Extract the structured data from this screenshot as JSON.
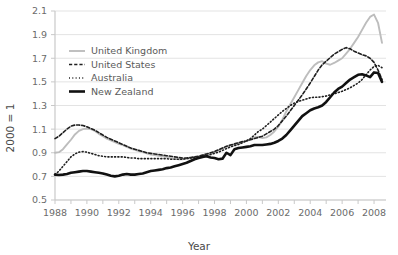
{
  "chart_data": {
    "type": "line",
    "title": "",
    "xlabel": "Year",
    "ylabel": "2000 = 1",
    "xlim": [
      1988,
      2008.75
    ],
    "ylim": [
      0.5,
      2.1
    ],
    "yticks": [
      0.5,
      0.7,
      0.9,
      1.1,
      1.3,
      1.5,
      1.7,
      1.9,
      2.1
    ],
    "ytick_labels": [
      "0.5",
      "0.7",
      "0.9",
      "1.1",
      "1.3",
      "1.5",
      "1.7",
      "1.9",
      "2.1"
    ],
    "xticks": [
      1988,
      1990,
      1992,
      1994,
      1996,
      1998,
      2000,
      2002,
      2004,
      2006,
      2008
    ],
    "xtick_labels": [
      "1988",
      "1990",
      "1992",
      "1994",
      "1996",
      "1998",
      "2000",
      "2002",
      "2004",
      "2006",
      "2008"
    ],
    "xminor_step": 1,
    "grid": "horizontal",
    "legend_position": "upper-left-inside",
    "colors": {
      "united_kingdom": "#bdbdbd",
      "united_states": "#1f1f1f",
      "australia": "#1f1f1f",
      "new_zealand": "#111111",
      "grid": "#e3e3e3",
      "axis": "#c9c9c9",
      "text": "#6b6b6b"
    },
    "series": [
      {
        "name": "United Kingdom",
        "style": "solid",
        "color": "#bdbdbd",
        "width": 1.9,
        "x": [
          1988.0,
          1988.25,
          1988.5,
          1988.75,
          1989.0,
          1989.25,
          1989.5,
          1989.75,
          1990.0,
          1990.25,
          1990.5,
          1990.75,
          1991.0,
          1991.25,
          1991.5,
          1991.75,
          1992.0,
          1992.25,
          1992.5,
          1992.75,
          1993.0,
          1993.25,
          1993.5,
          1993.75,
          1994.0,
          1994.25,
          1994.5,
          1994.75,
          1995.0,
          1995.25,
          1995.5,
          1995.75,
          1996.0,
          1996.25,
          1996.5,
          1996.75,
          1997.0,
          1997.25,
          1997.5,
          1997.75,
          1998.0,
          1998.25,
          1998.5,
          1998.75,
          1999.0,
          1999.25,
          1999.5,
          1999.75,
          2000.0,
          2000.25,
          2000.5,
          2000.75,
          2001.0,
          2001.25,
          2001.5,
          2001.75,
          2002.0,
          2002.25,
          2002.5,
          2002.75,
          2003.0,
          2003.25,
          2003.5,
          2003.75,
          2004.0,
          2004.25,
          2004.5,
          2004.75,
          2005.0,
          2005.25,
          2005.5,
          2005.75,
          2006.0,
          2006.25,
          2006.5,
          2006.75,
          2007.0,
          2007.25,
          2007.5,
          2007.75,
          2008.0,
          2008.25,
          2008.5
        ],
        "y": [
          0.9,
          0.905,
          0.93,
          0.97,
          1.01,
          1.055,
          1.085,
          1.1,
          1.105,
          1.1,
          1.085,
          1.06,
          1.04,
          1.02,
          1.005,
          0.99,
          0.975,
          0.965,
          0.95,
          0.935,
          0.925,
          0.915,
          0.905,
          0.895,
          0.885,
          0.88,
          0.875,
          0.87,
          0.865,
          0.855,
          0.85,
          0.845,
          0.845,
          0.85,
          0.855,
          0.86,
          0.865,
          0.875,
          0.885,
          0.895,
          0.905,
          0.92,
          0.935,
          0.95,
          0.96,
          0.97,
          0.98,
          0.99,
          1.0,
          1.015,
          1.03,
          1.035,
          1.025,
          1.03,
          1.05,
          1.08,
          1.12,
          1.18,
          1.25,
          1.31,
          1.37,
          1.43,
          1.49,
          1.55,
          1.6,
          1.64,
          1.665,
          1.675,
          1.655,
          1.645,
          1.66,
          1.68,
          1.7,
          1.74,
          1.78,
          1.83,
          1.88,
          1.94,
          2.0,
          2.05,
          2.07,
          2.0,
          1.83
        ]
      },
      {
        "name": "United States",
        "style": "dashed",
        "color": "#1f1f1f",
        "width": 1.6,
        "x": [
          1988.0,
          1988.25,
          1988.5,
          1988.75,
          1989.0,
          1989.25,
          1989.5,
          1989.75,
          1990.0,
          1990.25,
          1990.5,
          1990.75,
          1991.0,
          1991.25,
          1991.5,
          1991.75,
          1992.0,
          1992.25,
          1992.5,
          1992.75,
          1993.0,
          1993.25,
          1993.5,
          1993.75,
          1994.0,
          1994.25,
          1994.5,
          1994.75,
          1995.0,
          1995.25,
          1995.5,
          1995.75,
          1996.0,
          1996.25,
          1996.5,
          1996.75,
          1997.0,
          1997.25,
          1997.5,
          1997.75,
          1998.0,
          1998.25,
          1998.5,
          1998.75,
          1999.0,
          1999.25,
          1999.5,
          1999.75,
          2000.0,
          2000.25,
          2000.5,
          2000.75,
          2001.0,
          2001.25,
          2001.5,
          2001.75,
          2002.0,
          2002.25,
          2002.5,
          2002.75,
          2003.0,
          2003.25,
          2003.5,
          2003.75,
          2004.0,
          2004.25,
          2004.5,
          2004.75,
          2005.0,
          2005.25,
          2005.5,
          2005.75,
          2006.0,
          2006.25,
          2006.5,
          2006.75,
          2007.0,
          2007.25,
          2007.5,
          2007.75,
          2008.0,
          2008.25,
          2008.5
        ],
        "y": [
          1.02,
          1.04,
          1.07,
          1.1,
          1.125,
          1.135,
          1.135,
          1.13,
          1.12,
          1.105,
          1.09,
          1.07,
          1.05,
          1.03,
          1.015,
          1.0,
          0.985,
          0.97,
          0.955,
          0.94,
          0.93,
          0.92,
          0.91,
          0.9,
          0.895,
          0.89,
          0.885,
          0.88,
          0.875,
          0.87,
          0.865,
          0.86,
          0.855,
          0.855,
          0.86,
          0.865,
          0.87,
          0.88,
          0.89,
          0.9,
          0.91,
          0.925,
          0.94,
          0.955,
          0.965,
          0.975,
          0.985,
          0.995,
          1.0,
          1.01,
          1.02,
          1.03,
          1.04,
          1.06,
          1.08,
          1.1,
          1.13,
          1.17,
          1.21,
          1.255,
          1.3,
          1.345,
          1.39,
          1.44,
          1.49,
          1.545,
          1.6,
          1.645,
          1.675,
          1.705,
          1.735,
          1.755,
          1.775,
          1.79,
          1.78,
          1.76,
          1.745,
          1.73,
          1.72,
          1.7,
          1.665,
          1.6,
          1.52
        ]
      },
      {
        "name": "Australia",
        "style": "dotted",
        "color": "#1f1f1f",
        "width": 1.6,
        "x": [
          1988.0,
          1988.25,
          1988.5,
          1988.75,
          1989.0,
          1989.25,
          1989.5,
          1989.75,
          1990.0,
          1990.25,
          1990.5,
          1990.75,
          1991.0,
          1991.25,
          1991.5,
          1991.75,
          1992.0,
          1992.25,
          1992.5,
          1992.75,
          1993.0,
          1993.25,
          1993.5,
          1993.75,
          1994.0,
          1994.25,
          1994.5,
          1994.75,
          1995.0,
          1995.25,
          1995.5,
          1995.75,
          1996.0,
          1996.25,
          1996.5,
          1996.75,
          1997.0,
          1997.25,
          1997.5,
          1997.75,
          1998.0,
          1998.25,
          1998.5,
          1998.75,
          1999.0,
          1999.25,
          1999.5,
          1999.75,
          2000.0,
          2000.25,
          2000.5,
          2000.75,
          2001.0,
          2001.25,
          2001.5,
          2001.75,
          2002.0,
          2002.25,
          2002.5,
          2002.75,
          2003.0,
          2003.25,
          2003.5,
          2003.75,
          2004.0,
          2004.25,
          2004.5,
          2004.75,
          2005.0,
          2005.25,
          2005.5,
          2005.75,
          2006.0,
          2006.25,
          2006.5,
          2006.75,
          2007.0,
          2007.25,
          2007.5,
          2007.75,
          2008.0,
          2008.25,
          2008.5
        ],
        "y": [
          0.715,
          0.745,
          0.785,
          0.825,
          0.865,
          0.89,
          0.905,
          0.91,
          0.905,
          0.895,
          0.885,
          0.875,
          0.87,
          0.865,
          0.865,
          0.865,
          0.865,
          0.865,
          0.86,
          0.855,
          0.855,
          0.85,
          0.85,
          0.85,
          0.85,
          0.85,
          0.85,
          0.85,
          0.85,
          0.845,
          0.845,
          0.845,
          0.845,
          0.85,
          0.855,
          0.86,
          0.865,
          0.87,
          0.875,
          0.885,
          0.895,
          0.905,
          0.92,
          0.935,
          0.95,
          0.96,
          0.97,
          0.985,
          1.0,
          1.02,
          1.05,
          1.08,
          1.1,
          1.13,
          1.16,
          1.19,
          1.22,
          1.25,
          1.275,
          1.3,
          1.32,
          1.335,
          1.345,
          1.355,
          1.365,
          1.37,
          1.37,
          1.375,
          1.38,
          1.39,
          1.4,
          1.41,
          1.42,
          1.435,
          1.45,
          1.47,
          1.49,
          1.52,
          1.56,
          1.6,
          1.63,
          1.64,
          1.62
        ]
      },
      {
        "name": "New Zealand",
        "style": "solid",
        "color": "#111111",
        "width": 2.6,
        "x": [
          1988.0,
          1988.25,
          1988.5,
          1988.75,
          1989.0,
          1989.25,
          1989.5,
          1989.75,
          1990.0,
          1990.25,
          1990.5,
          1990.75,
          1991.0,
          1991.25,
          1991.5,
          1991.75,
          1992.0,
          1992.25,
          1992.5,
          1992.75,
          1993.0,
          1993.25,
          1993.5,
          1993.75,
          1994.0,
          1994.25,
          1994.5,
          1994.75,
          1995.0,
          1995.25,
          1995.5,
          1995.75,
          1996.0,
          1996.25,
          1996.5,
          1996.75,
          1997.0,
          1997.25,
          1997.5,
          1997.75,
          1998.0,
          1998.25,
          1998.5,
          1998.75,
          1999.0,
          1999.25,
          1999.5,
          1999.75,
          2000.0,
          2000.25,
          2000.5,
          2000.75,
          2001.0,
          2001.25,
          2001.5,
          2001.75,
          2002.0,
          2002.25,
          2002.5,
          2002.75,
          2003.0,
          2003.25,
          2003.5,
          2003.75,
          2004.0,
          2004.25,
          2004.5,
          2004.75,
          2005.0,
          2005.25,
          2005.5,
          2005.75,
          2006.0,
          2006.25,
          2006.5,
          2006.75,
          2007.0,
          2007.25,
          2007.5,
          2007.75,
          2008.0,
          2008.25,
          2008.5
        ],
        "y": [
          0.715,
          0.712,
          0.715,
          0.72,
          0.73,
          0.735,
          0.74,
          0.745,
          0.745,
          0.74,
          0.735,
          0.73,
          0.725,
          0.715,
          0.705,
          0.7,
          0.705,
          0.715,
          0.72,
          0.715,
          0.715,
          0.72,
          0.725,
          0.735,
          0.745,
          0.75,
          0.755,
          0.76,
          0.77,
          0.775,
          0.785,
          0.795,
          0.805,
          0.815,
          0.83,
          0.845,
          0.855,
          0.865,
          0.87,
          0.86,
          0.855,
          0.845,
          0.85,
          0.9,
          0.88,
          0.93,
          0.94,
          0.945,
          0.95,
          0.955,
          0.965,
          0.965,
          0.965,
          0.97,
          0.975,
          0.985,
          1.0,
          1.02,
          1.05,
          1.09,
          1.13,
          1.17,
          1.21,
          1.235,
          1.26,
          1.275,
          1.285,
          1.3,
          1.33,
          1.37,
          1.41,
          1.44,
          1.46,
          1.49,
          1.52,
          1.54,
          1.56,
          1.565,
          1.555,
          1.54,
          1.58,
          1.575,
          1.5
        ]
      }
    ]
  },
  "legend": {
    "items": [
      {
        "label": "United Kingdom",
        "key": "united-kingdom"
      },
      {
        "label": "United States",
        "key": "united-states"
      },
      {
        "label": "Australia",
        "key": "australia"
      },
      {
        "label": "New Zealand",
        "key": "new-zealand"
      }
    ]
  }
}
